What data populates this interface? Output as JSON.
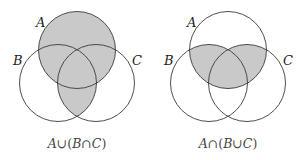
{
  "colors": {
    "outline": "#3a3a3a",
    "shade": "#c9c9c9",
    "label": "#222222",
    "caption": "#444444",
    "background": "#ffffff"
  },
  "diagrams": [
    {
      "name": "union-diagram",
      "caption": {
        "A": "A",
        "op1": "∪",
        "open": "(",
        "B": "B",
        "op2": "∩",
        "C": "C",
        "close": ")"
      },
      "caption_text": "A ∪ (B ∩ C)",
      "shaded_region": "A ∪ (B ∩ C)",
      "labels": {
        "A": "A",
        "B": "B",
        "C": "C"
      }
    },
    {
      "name": "intersection-diagram",
      "caption": {
        "A": "A",
        "op1": "∩",
        "open": "(",
        "B": "B",
        "op2": "∪",
        "C": "C",
        "close": ")"
      },
      "caption_text": "A ∩ (B ∪ C)",
      "shaded_region": "A ∩ (B ∪ C)",
      "labels": {
        "A": "A",
        "B": "B",
        "C": "C"
      }
    }
  ]
}
